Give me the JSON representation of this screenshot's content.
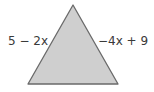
{
  "diagram": {
    "shape": "triangle",
    "fill_color": "#cfcfcf",
    "stroke_color": "#6a6a6a",
    "vertices": {
      "apex": [
        73,
        5
      ],
      "bottom_left": [
        28,
        84
      ],
      "bottom_right": [
        118,
        84
      ]
    },
    "left_side_label": "5 − 2x",
    "right_side_label": "−4x + 9"
  }
}
